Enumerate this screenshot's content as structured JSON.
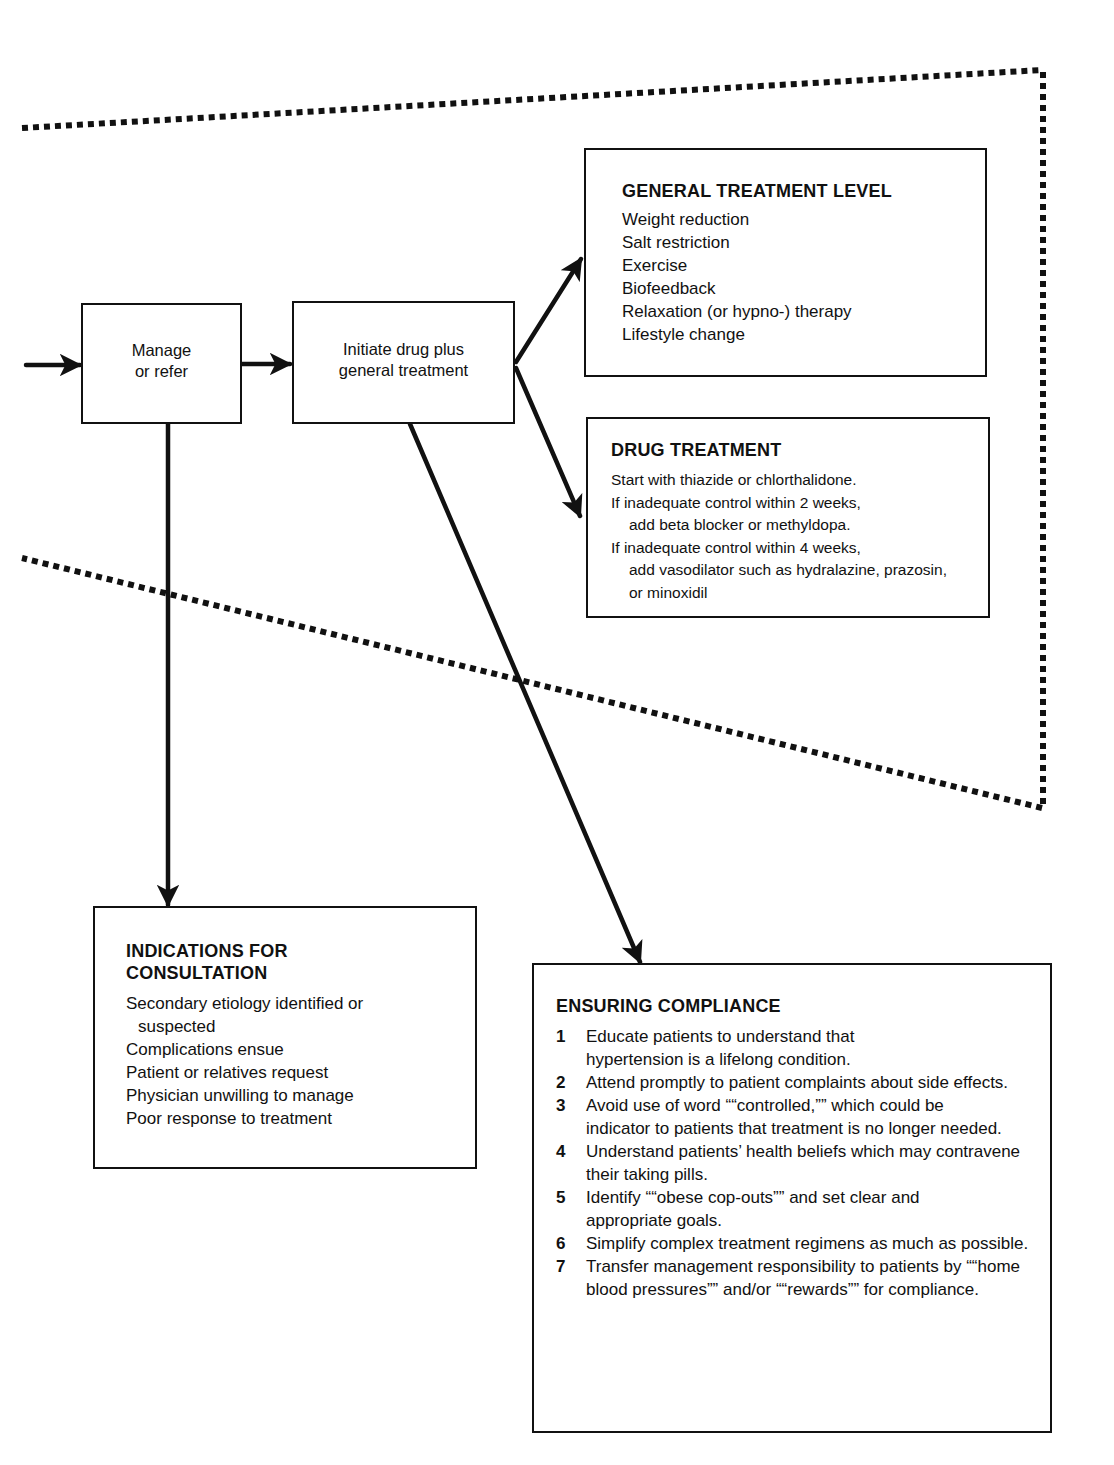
{
  "flow": {
    "manage_box": {
      "line1": "Manage",
      "line2": "or refer"
    },
    "initiate_box": {
      "line1": "Initiate drug plus",
      "line2": "general treatment"
    }
  },
  "general_treatment": {
    "title": "GENERAL TREATMENT LEVEL",
    "items": [
      "Weight reduction",
      "Salt restriction",
      "Exercise",
      "Biofeedback",
      "Relaxation (or hypno-) therapy",
      "Lifestyle change"
    ]
  },
  "drug_treatment": {
    "title": "DRUG TREATMENT",
    "items": [
      {
        "text": "Start with thiazide or chlorthalidone.",
        "cont": ""
      },
      {
        "text": "If inadequate control within 2 weeks,",
        "cont": "add beta blocker or methyldopa."
      },
      {
        "text": "If inadequate control within 4 weeks,",
        "cont": "add vasodilator such as hydralazine, prazosin, or minoxidil"
      }
    ]
  },
  "indications": {
    "title_line1": "INDICATIONS FOR",
    "title_line2": "CONSULTATION",
    "items": [
      {
        "text": "Secondary etiology identified or",
        "cont": "suspected"
      },
      {
        "text": "Complications ensue",
        "cont": ""
      },
      {
        "text": "Patient or relatives request",
        "cont": ""
      },
      {
        "text": "Physician unwilling to manage",
        "cont": ""
      },
      {
        "text": "Poor response to treatment",
        "cont": ""
      }
    ]
  },
  "compliance": {
    "title": "ENSURING COMPLIANCE",
    "items": [
      {
        "num": "1",
        "text": "Educate patients to understand that hypertension is a lifelong condition."
      },
      {
        "num": "2",
        "text": "Attend promptly to patient complaints about side effects."
      },
      {
        "num": "3",
        "text": "Avoid use of word ““controlled,”” which could be indicator to patients that treatment is no longer needed."
      },
      {
        "num": "4",
        "text": "Understand patients’ health beliefs which may contravene their taking pills."
      },
      {
        "num": "5",
        "text": "Identify ““obese cop-outs”” and set clear and appropriate goals."
      },
      {
        "num": "6",
        "text": "Simplify complex treatment regimens as much as possible."
      },
      {
        "num": "7",
        "text": "Transfer management responsibility to patients by ““home blood pressures”” and/or ““rewards”” for compliance."
      }
    ]
  }
}
